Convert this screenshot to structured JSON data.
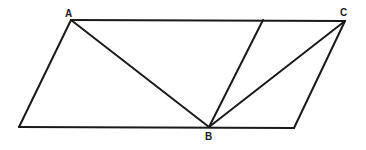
{
  "diagram": {
    "type": "geometry",
    "stroke_color": "#1a1a1a",
    "background": "#ffffff",
    "points": {
      "A": {
        "label": "A",
        "x": 71,
        "y": 20
      },
      "C": {
        "label": "C",
        "x": 345,
        "y": 21
      },
      "B": {
        "label": "B",
        "x": 209,
        "y": 127
      },
      "BL": {
        "label": "",
        "x": 19,
        "y": 127
      },
      "BR": {
        "label": "",
        "x": 294,
        "y": 128
      },
      "T": {
        "label": "",
        "x": 263,
        "y": 20
      }
    },
    "labels": {
      "A": "A",
      "B": "B",
      "C": "C"
    },
    "segments": [
      [
        "A",
        "C"
      ],
      [
        "C",
        "BR"
      ],
      [
        "BR",
        "BL"
      ],
      [
        "BL",
        "A"
      ],
      [
        "A",
        "B"
      ],
      [
        "B",
        "T"
      ],
      [
        "B",
        "C"
      ]
    ]
  }
}
